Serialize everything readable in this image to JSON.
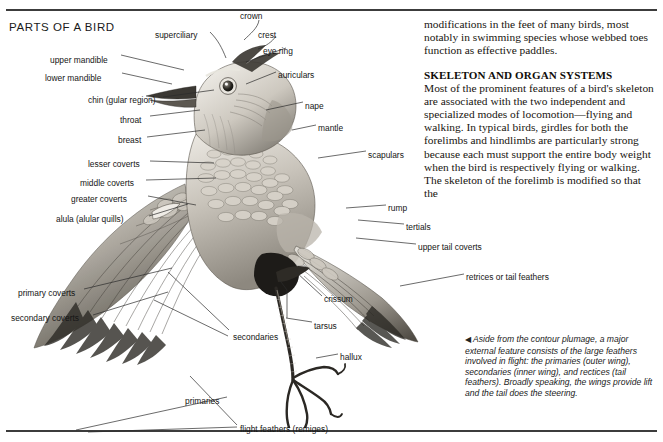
{
  "page": {
    "title": "PARTS OF A BIRD"
  },
  "diagram": {
    "name": "bird-anatomy-illustration",
    "labels": [
      {
        "id": "crown",
        "text": "crown",
        "x": 240,
        "y": 11,
        "align": "left"
      },
      {
        "id": "superciliary",
        "text": "superciliary",
        "x": 155,
        "y": 30,
        "align": "left"
      },
      {
        "id": "crest",
        "text": "crest",
        "x": 258,
        "y": 30,
        "align": "left"
      },
      {
        "id": "eye-ring",
        "text": "eye ring",
        "x": 263,
        "y": 46,
        "align": "left"
      },
      {
        "id": "upper-mandible",
        "text": "upper mandible",
        "x": 50,
        "y": 55,
        "align": "left"
      },
      {
        "id": "auriculars",
        "text": "auriculars",
        "x": 278,
        "y": 70,
        "align": "left"
      },
      {
        "id": "lower-mandible",
        "text": "lower mandible",
        "x": 45,
        "y": 73,
        "align": "left"
      },
      {
        "id": "chin",
        "text": "chin (gular region)",
        "x": 88,
        "y": 95,
        "align": "left"
      },
      {
        "id": "nape",
        "text": "nape",
        "x": 305,
        "y": 101,
        "align": "left"
      },
      {
        "id": "throat",
        "text": "throat",
        "x": 120,
        "y": 115,
        "align": "left"
      },
      {
        "id": "mantle",
        "text": "mantle",
        "x": 318,
        "y": 123,
        "align": "left"
      },
      {
        "id": "breast",
        "text": "breast",
        "x": 118,
        "y": 135,
        "align": "left"
      },
      {
        "id": "scapulars",
        "text": "scapulars",
        "x": 368,
        "y": 150,
        "align": "left"
      },
      {
        "id": "lesser-coverts",
        "text": "lesser coverts",
        "x": 88,
        "y": 159,
        "align": "left"
      },
      {
        "id": "middle-coverts",
        "text": "middle coverts",
        "x": 80,
        "y": 178,
        "align": "left"
      },
      {
        "id": "greater-coverts",
        "text": "greater coverts",
        "x": 71,
        "y": 194,
        "align": "left"
      },
      {
        "id": "rump",
        "text": "rump",
        "x": 388,
        "y": 203,
        "align": "left"
      },
      {
        "id": "alula",
        "text": "alula (alular quills)",
        "x": 56,
        "y": 214,
        "align": "left"
      },
      {
        "id": "tertials",
        "text": "tertials",
        "x": 406,
        "y": 222,
        "align": "left"
      },
      {
        "id": "upper-tail-coverts",
        "text": "upper tail coverts",
        "x": 418,
        "y": 242,
        "align": "left"
      },
      {
        "id": "retrices",
        "text": "retrices or tail feathers",
        "x": 466,
        "y": 272,
        "align": "left"
      },
      {
        "id": "primary-coverts",
        "text": "primary coverts",
        "x": 18,
        "y": 288,
        "align": "left"
      },
      {
        "id": "crissum",
        "text": "crissum",
        "x": 324,
        "y": 294,
        "align": "left"
      },
      {
        "id": "secondary-coverts",
        "text": "secondary coverts",
        "x": 11,
        "y": 313,
        "align": "left"
      },
      {
        "id": "tarsus",
        "text": "tarsus",
        "x": 314,
        "y": 321,
        "align": "left"
      },
      {
        "id": "secondaries",
        "text": "secondaries",
        "x": 233,
        "y": 332,
        "align": "left"
      },
      {
        "id": "hallux",
        "text": "hallux",
        "x": 340,
        "y": 352,
        "align": "left"
      },
      {
        "id": "primaries",
        "text": "primaries",
        "x": 185,
        "y": 396,
        "align": "left"
      },
      {
        "id": "flight-feathers",
        "text": "flight feathers (remiges)",
        "x": 240,
        "y": 424,
        "align": "left"
      }
    ]
  },
  "article": {
    "continued_paragraph": "modifications in the feet of many birds, most notably in swimming species whose webbed toes function as effective paddles.",
    "section_heading": "SKELETON AND ORGAN SYSTEMS",
    "section_paragraph": "Most of the prominent features of a bird's skeleton are associated with the two independent and specialized modes of locomotion—flying and walking. In typical birds, girdles for both the forelimbs and hindlimbs are particularly strong because each must support the entire body weight when the bird is respectively flying or walking. The skeleton of the forelimb is modified so that the"
  },
  "caption": {
    "marker": "◀",
    "text": " Aside from the contour plumage, a major external feature consists of the large feathers involved in flight: the primaries (outer wing), secondaries (inner wing), and rectices (tail feathers). Broadly speaking, the wings provide lift and the tail does the steering."
  },
  "colors": {
    "rule": "#3c3c3c",
    "text": "#151515",
    "body_text": "#17140f"
  }
}
